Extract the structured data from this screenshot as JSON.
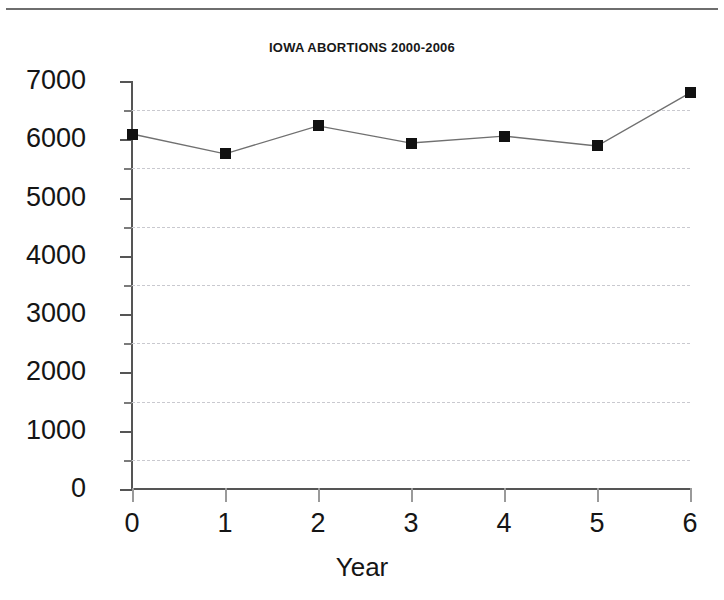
{
  "chart_data": {
    "type": "line",
    "title": "IOWA ABORTIONS 2000-2006",
    "xlabel": "Year",
    "ylabel": "",
    "x": [
      0,
      1,
      2,
      3,
      4,
      5,
      6
    ],
    "values": [
      6090,
      5750,
      6230,
      5935,
      6055,
      5885,
      6795
    ],
    "series": [
      {
        "name": "Iowa abortions",
        "values": [
          6090,
          5750,
          6230,
          5935,
          6055,
          5885,
          6795
        ]
      }
    ],
    "xlim": [
      0,
      6
    ],
    "ylim": [
      0,
      7000
    ],
    "xticks": [
      "0",
      "1",
      "2",
      "3",
      "4",
      "5",
      "6"
    ],
    "yticks": [
      "0",
      "1000",
      "2000",
      "3000",
      "4000",
      "5000",
      "6000",
      "7000"
    ],
    "y_minor_gridlines": [
      500,
      1500,
      2500,
      3500,
      4500,
      5500,
      6500
    ],
    "grid": true,
    "grid_style": "dotted-horizontal-minor-only",
    "legend": null,
    "marker": "filled-square",
    "line_color": "#707070",
    "marker_color": "#111111"
  },
  "figure": {
    "background": "#ffffff",
    "page_rule": true
  }
}
